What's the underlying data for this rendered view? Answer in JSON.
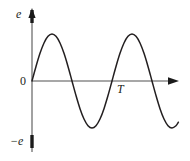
{
  "figure": {
    "background_color": "#ffffff",
    "axis_color": "#8a8a8a",
    "tick_color": "#1a1a1a",
    "curve_color": "#231f20",
    "labels": {
      "y_axis_top": "e",
      "y_axis_origin": "0",
      "y_axis_bottom": "−e",
      "x_axis_period": "T"
    }
  },
  "chart_data": {
    "type": "line",
    "title": "",
    "xlabel": "",
    "ylabel": "e",
    "grid": false,
    "legend": null,
    "axis_arrows": {
      "x": "right",
      "y": "up"
    },
    "ylim": [
      -1,
      1
    ],
    "xlim": [
      0,
      1.83
    ],
    "ytick_labels": [
      "e",
      "0",
      "−e"
    ],
    "ytick_values": [
      1,
      0,
      -1
    ],
    "xtick_labels": [
      "T"
    ],
    "xtick_values": [
      1
    ],
    "period": 1,
    "amplitude": 1,
    "series": [
      {
        "name": "e(t)",
        "color": "#231f20",
        "x": [
          0.0,
          0.05,
          0.1,
          0.15,
          0.2,
          0.25,
          0.3,
          0.35,
          0.4,
          0.45,
          0.5,
          0.55,
          0.6,
          0.65,
          0.7,
          0.75,
          0.8,
          0.85,
          0.9,
          0.95,
          1.0,
          1.05,
          1.1,
          1.15,
          1.2,
          1.25,
          1.3,
          1.35,
          1.4,
          1.45,
          1.5,
          1.55,
          1.6,
          1.65,
          1.7,
          1.75,
          1.8,
          1.83
        ],
        "y": [
          0.0,
          0.309,
          0.588,
          0.809,
          0.951,
          1.0,
          0.951,
          0.809,
          0.588,
          0.309,
          0.0,
          -0.309,
          -0.588,
          -0.809,
          -0.951,
          -1.0,
          -0.951,
          -0.809,
          -0.588,
          -0.309,
          0.0,
          0.309,
          0.588,
          0.809,
          0.951,
          1.0,
          0.951,
          0.809,
          0.588,
          0.309,
          0.0,
          -0.309,
          -0.588,
          -0.809,
          -0.951,
          -1.0,
          -0.951,
          -0.876
        ]
      }
    ]
  }
}
